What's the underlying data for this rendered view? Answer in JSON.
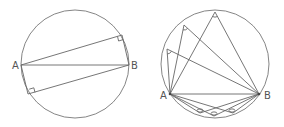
{
  "figures": [
    {
      "name": "left-figure",
      "description": "Circle with diameter AB and two right angles inscribed",
      "circle": {
        "cx": 75,
        "cy": 64,
        "r": 54
      },
      "points": {
        "A": [
          21,
          65
        ],
        "B": [
          129,
          65
        ],
        "P": [
          122,
          35
        ],
        "Q": [
          28,
          94
        ]
      },
      "labels": {
        "A": "A",
        "B": "B"
      }
    },
    {
      "name": "right-figure",
      "description": "Circle with chord AB and several inscribed angles on both arcs",
      "circle": {
        "cx": 215,
        "cy": 64,
        "r": 54
      },
      "points": {
        "A": [
          170,
          94
        ],
        "B": [
          259,
          94
        ],
        "upper": [
          [
            215,
            12
          ],
          [
            184,
            25
          ],
          [
            167,
            49
          ]
        ],
        "lower": [
          [
            200,
            113
          ],
          [
            214,
            116
          ],
          [
            233,
            113
          ]
        ]
      },
      "labels": {
        "A": "A",
        "B": "B"
      }
    }
  ]
}
